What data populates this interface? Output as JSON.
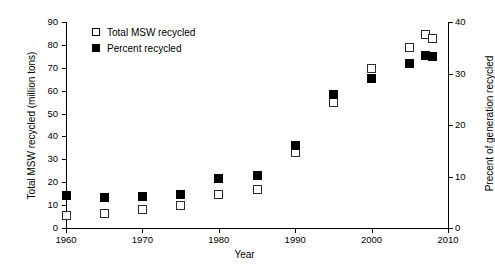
{
  "chart_data": {
    "type": "scatter",
    "title": "",
    "xlabel": "Year",
    "ylabel": "Total MSW recycled (million tons)",
    "y2label": "Precent of generation recycled",
    "xlim": [
      1960,
      2010
    ],
    "ylim": [
      0,
      90
    ],
    "y2lim": [
      0,
      40
    ],
    "grid": false,
    "legend_position": "top-left",
    "xticks": [
      1960,
      1970,
      1980,
      1990,
      2000,
      2010
    ],
    "xtick_labels": [
      "1960",
      "1970",
      "1980",
      "1990",
      "2000",
      "2010"
    ],
    "yticks": [
      0,
      10,
      20,
      30,
      40,
      50,
      60,
      70,
      80,
      90
    ],
    "ytick_labels": [
      "0",
      "10",
      "20",
      "30",
      "40",
      "50",
      "60",
      "70",
      "80",
      "90"
    ],
    "y2ticks": [
      0,
      10,
      20,
      30,
      40
    ],
    "y2tick_labels": [
      "0",
      "10",
      "20",
      "30",
      "40"
    ],
    "x": [
      1960,
      1965,
      1970,
      1975,
      1980,
      1985,
      1990,
      1995,
      2000,
      2005,
      2007,
      2008
    ],
    "series": [
      {
        "name": "Total MSW recycled",
        "marker": "open-square",
        "color": "#ffffff",
        "edge_color": "#2b2b2b",
        "axis": "left",
        "units": "million tons",
        "values": [
          5.6,
          6.4,
          8.0,
          9.9,
          14.5,
          16.7,
          33.2,
          55.0,
          69.5,
          79.0,
          84.5,
          83.0
        ]
      },
      {
        "name": "Percent recycled",
        "marker": "filled-square",
        "color": "#000000",
        "edge_color": "#000000",
        "axis": "right",
        "units": "percent of generation",
        "values": [
          6.4,
          6.0,
          6.2,
          6.6,
          9.6,
          10.1,
          16.0,
          26.0,
          29.0,
          32.0,
          33.5,
          33.3
        ]
      }
    ]
  },
  "legend": {
    "items": [
      {
        "label": "Total MSW recycled",
        "swatch": "open-square"
      },
      {
        "label": "Percent recycled",
        "swatch": "filled-square"
      }
    ]
  },
  "axes": {
    "x_title": "Year",
    "y_left_title": "Total MSW recycled (million tons)",
    "y_right_title": "Precent of generation recycled"
  }
}
